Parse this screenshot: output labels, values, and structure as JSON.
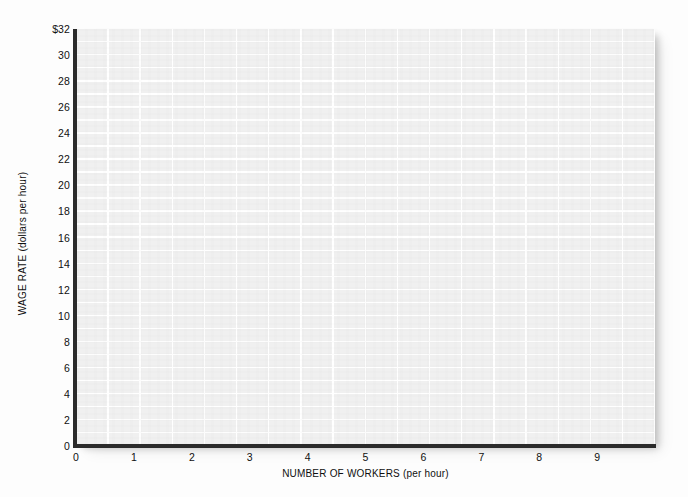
{
  "chart_data": {
    "type": "line",
    "title": "",
    "subtitle": "",
    "xlabel": "NUMBER OF WORKERS (per hour)",
    "ylabel": "WAGE RATE (dollars per hour)",
    "xlim": [
      0,
      10
    ],
    "ylim": [
      0,
      32
    ],
    "x_ticks": [
      "0",
      "1",
      "2",
      "3",
      "4",
      "5",
      "6",
      "7",
      "8",
      "9"
    ],
    "x_tick_values": [
      0,
      1,
      2,
      3,
      4,
      5,
      6,
      7,
      8,
      9
    ],
    "y_ticks": [
      "0",
      "2",
      "4",
      "6",
      "8",
      "10",
      "12",
      "14",
      "16",
      "18",
      "20",
      "22",
      "24",
      "26",
      "28",
      "30",
      "$32"
    ],
    "y_tick_values": [
      0,
      2,
      4,
      6,
      8,
      10,
      12,
      14,
      16,
      18,
      20,
      22,
      24,
      26,
      28,
      30,
      32
    ],
    "grid": true,
    "legend": false,
    "legend_position": "none",
    "series": [],
    "annotations": [],
    "note": "Empty plotting grid — no data series are drawn on the axes."
  },
  "style": {
    "plot_background": "#f0f0f0",
    "gridline_color": "#ffffff",
    "axis_color": "#2b2b2b",
    "text_color": "#101010",
    "page_background": "#fdfdfd"
  }
}
